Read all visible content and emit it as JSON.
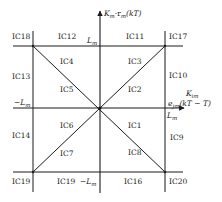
{
  "diagram": {
    "axes": {
      "vertical_label": "K_m·r_m(kT)",
      "vertical_label_parts": {
        "main": "K",
        "sub1": "m",
        "mid": "·r",
        "sub2": "m",
        "tail": "(kT)"
      },
      "horizontal_label_line1": {
        "main": "K",
        "sub": "im"
      },
      "horizontal_label_line2": {
        "main": "e",
        "sub": "jm",
        "tail": "(kT − T)"
      }
    },
    "ticks": {
      "top_Lm": {
        "main": "L",
        "sub": "m"
      },
      "right_Lm": {
        "main": "L",
        "sub": "m"
      },
      "left_negLm": {
        "main": "−L",
        "sub": "m"
      },
      "bottom_negLm": {
        "main": "−L",
        "sub": "m"
      }
    },
    "regions": {
      "ic1": "IC1",
      "ic2": "IC2",
      "ic3": "IC3",
      "ic4": "IC4",
      "ic5": "IC5",
      "ic6": "IC6",
      "ic7": "IC7",
      "ic8": "IC8",
      "ic9": "IC9",
      "ic10": "IC10",
      "ic11": "IC11",
      "ic12": "IC12",
      "ic13": "IC13",
      "ic14": "IC14",
      "ic16": "IC16",
      "ic17": "IC17",
      "ic18": "IC18",
      "ic19a": "IC19",
      "ic19b": "IC19",
      "ic20": "IC20"
    },
    "colors": {
      "line": "#1a1a1a",
      "text": "#222222",
      "background": "#ffffff"
    }
  }
}
